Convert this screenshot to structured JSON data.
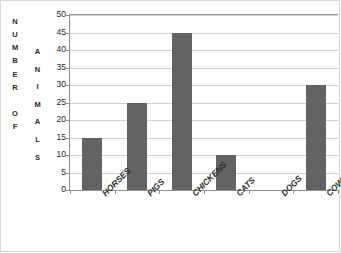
{
  "chart_data": {
    "type": "bar",
    "title": "",
    "subtitle": "",
    "xlabel": "",
    "ylabel": "NUMBER OF ANIMALS",
    "ylabel_outer": "NUMBER OF",
    "ylabel_inner": "ANIMALS",
    "categories": [
      "HORSES",
      "PIGS",
      "CHICKENS",
      "CATS",
      "DOGS",
      "COWS"
    ],
    "values": [
      15,
      25,
      45,
      10,
      0,
      30
    ],
    "ylim": [
      0,
      50
    ],
    "ytick_step": 5,
    "yticks": [
      50,
      45,
      40,
      35,
      30,
      25,
      20,
      15,
      10,
      5,
      0
    ],
    "grid": true,
    "grid_axis": "y",
    "legend": "none",
    "bar_color": "#636363",
    "grid_color": "#cfcfcf",
    "axis_color": "#8f8f8f",
    "background_color": "#fefefe"
  },
  "axis_titles": {
    "outer_letters": [
      "N",
      "U",
      "M",
      "B",
      "E",
      "R",
      "",
      "O",
      "F"
    ],
    "inner_letters": [
      "A",
      "N",
      "I",
      "M",
      "A",
      "L",
      "S"
    ]
  }
}
